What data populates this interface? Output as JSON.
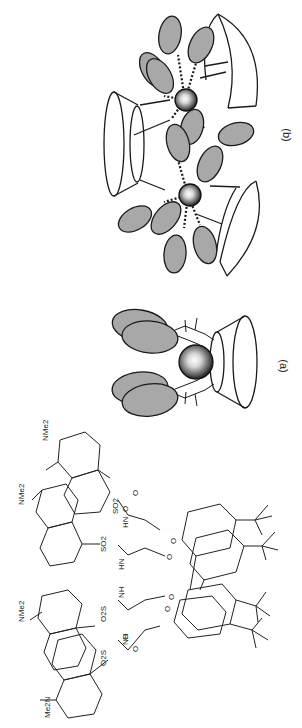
{
  "figure": {
    "orientation": "rotated-90-clockwise",
    "panels": [
      {
        "id": "b",
        "label": "(b)",
        "description": "Two metal ions bridged between three cone-shaped calixarene hosts with grey ellipsoid pendant groups; dotted coordination bonds"
      },
      {
        "id": "a",
        "label": "(a)",
        "description": "Single metal ion inside one cone-shaped calixarene host with two pairs of grey ellipsoid pendant groups"
      }
    ],
    "structure": {
      "labels": {
        "nme2_top_left": "NMe2",
        "nme2_top_mid": "NMe2",
        "nme2_bottom_mid": "NMe2",
        "me2n_bottom_left": "Me2N",
        "so2_1": "SO2",
        "so2_2": "SO2",
        "so2_3": "O2S",
        "so2_4": "O2S",
        "hn_1": "HN",
        "hn_2": "HN",
        "nh_1": "NH",
        "nh_2": "NH",
        "o_carbonyl_1": "O",
        "o_carbonyl_2": "O",
        "o_carbonyl_3": "O",
        "o_carbonyl_4": "O",
        "o_ether_1": "O",
        "o_ether_2": "O",
        "o_ether_3": "O",
        "o_ether_4": "O"
      }
    },
    "colors": {
      "ellipse_fill": "#a8a8a8",
      "stroke": "#1a1a1a",
      "background": "#ffffff"
    }
  }
}
